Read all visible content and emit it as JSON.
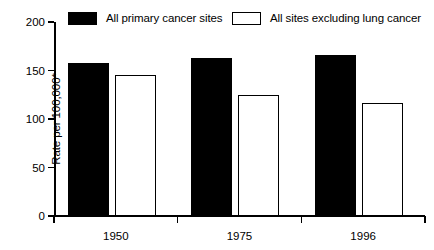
{
  "chart_data": {
    "type": "bar",
    "title": "",
    "xlabel": "",
    "ylabel": "Rate per 100,000*",
    "categories": [
      "1950",
      "1975",
      "1996"
    ],
    "ylim": [
      0,
      200
    ],
    "yticks": [
      0,
      50,
      100,
      150,
      200
    ],
    "ytick_labels": [
      "0",
      "50",
      "100",
      "150",
      "200"
    ],
    "grid": false,
    "legend_position": "top",
    "series": [
      {
        "name": "All primary cancer sites",
        "color": "#000000",
        "style": "filled",
        "values": [
          158,
          163,
          166
        ]
      },
      {
        "name": "All sites excluding lung cancer",
        "color": "#ffffff",
        "style": "hollow",
        "values": [
          145,
          125,
          116
        ]
      }
    ]
  },
  "colors": {
    "axis": "#000000",
    "background": "#ffffff",
    "series_filled": "#000000",
    "series_hollow": "#ffffff"
  }
}
